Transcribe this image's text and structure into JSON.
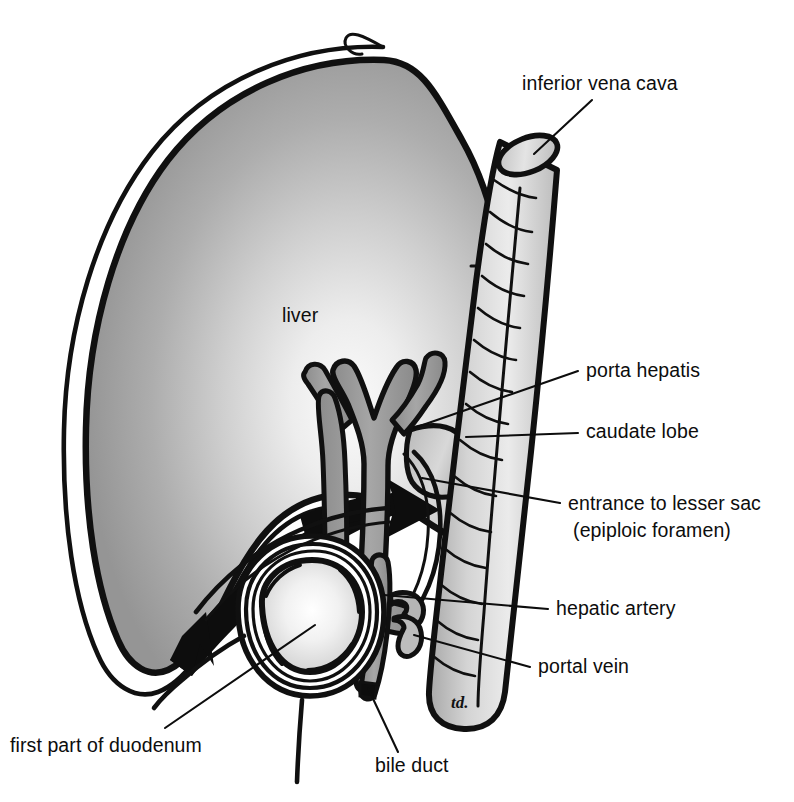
{
  "figure": {
    "background_color": "#ffffff",
    "ink_color": "#0d0d0d",
    "signature": "td."
  },
  "palette": {
    "liver_light": "#f2f2f2",
    "liver_mid": "#b4b4b4",
    "liver_dark": "#8f8f8f",
    "vessel_gray": "#999999",
    "vessel_light": "#c9c9c9",
    "ivc_light": "#e6e6e6",
    "ivc_mid": "#bfbfbf",
    "outline": "#101010",
    "arrow_black": "#0d0d0d"
  },
  "labels": [
    {
      "id": "inferior-vena-cava",
      "text": "inferior vena cava",
      "x": 522,
      "y": 90,
      "anchor": "start",
      "leader": "M 592 100 L 534 154"
    },
    {
      "id": "porta-hepatis",
      "text": "porta hepatis",
      "x": 586,
      "y": 377,
      "anchor": "start",
      "leader": "M 578 371 L 414 428"
    },
    {
      "id": "caudate-lobe",
      "text": "caudate lobe",
      "x": 586,
      "y": 438,
      "anchor": "start",
      "leader": "M 578 433 L 466 437"
    },
    {
      "id": "entrance-to-lesser-sac",
      "text": "entrance to lesser sac",
      "x": 568,
      "y": 510,
      "anchor": "start",
      "leader": "M 560 503 L 422 478"
    },
    {
      "id": "epiploic-foramen",
      "text": "(epiploic foramen)",
      "x": 652,
      "y": 537,
      "anchor": "middle",
      "leader": ""
    },
    {
      "id": "hepatic-artery",
      "text": "hepatic artery",
      "x": 556,
      "y": 615,
      "anchor": "start",
      "leader": "M 548 609 L 384 595"
    },
    {
      "id": "portal-vein",
      "text": "portal vein",
      "x": 538,
      "y": 673,
      "anchor": "start",
      "leader": "M 530 667 L 414 635"
    },
    {
      "id": "bile-duct",
      "text": "bile duct",
      "x": 375,
      "y": 772,
      "anchor": "start",
      "leader": "M 398 752 L 368 688"
    },
    {
      "id": "first-part-of-duodenum",
      "text": "first part of duodenum",
      "x": 10,
      "y": 752,
      "anchor": "start",
      "leader": "M 165 728 L 315 625"
    },
    {
      "id": "liver",
      "text": "liver",
      "x": 282,
      "y": 322,
      "anchor": "start",
      "leader": ""
    }
  ],
  "structures": [
    {
      "id": "liver",
      "name": "liver"
    },
    {
      "id": "inferior-vena-cava",
      "name": "inferior vena cava"
    },
    {
      "id": "caudate-lobe",
      "name": "caudate lobe"
    },
    {
      "id": "porta-hepatis",
      "name": "porta hepatis"
    },
    {
      "id": "hepatic-artery",
      "name": "hepatic artery"
    },
    {
      "id": "portal-vein",
      "name": "portal vein"
    },
    {
      "id": "bile-duct",
      "name": "bile duct"
    },
    {
      "id": "first-part-of-duodenum",
      "name": "first part of duodenum"
    },
    {
      "id": "epiploic-foramen-arrow",
      "name": "entrance to lesser sac (epiploic foramen)"
    }
  ]
}
